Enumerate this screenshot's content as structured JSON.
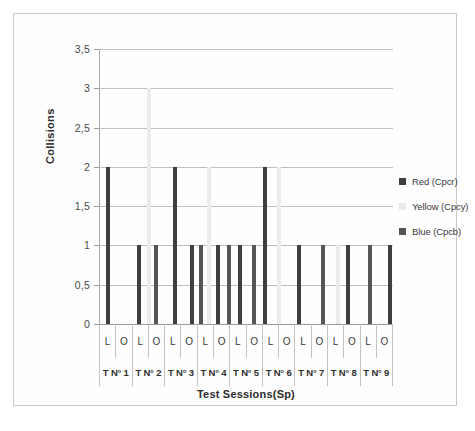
{
  "chart_data": {
    "type": "bar",
    "title": "",
    "xlabel": "Test Sessions(Sp)",
    "ylabel": "Collisions",
    "ylim": [
      0,
      3.5
    ],
    "ytick_labels": [
      "0",
      "0,5",
      "1",
      "1,5",
      "2",
      "2,5",
      "3",
      "3,5"
    ],
    "ytick_values": [
      0,
      0.5,
      1,
      1.5,
      2,
      2.5,
      3,
      3.5
    ],
    "grid": true,
    "legend_position": "right",
    "series": [
      {
        "name": "Red (Cpcr)",
        "color": "#3f3f3f"
      },
      {
        "name": "Yellow (Cpcy)",
        "color": "#ebebeb"
      },
      {
        "name": "Blue (Cpcb)",
        "color": "#555555"
      }
    ],
    "categories": [
      "T N° 1 L",
      "T N° 1 O",
      "T N° 2 L",
      "T N° 2 O",
      "T N° 3 L",
      "T N° 3 O",
      "T N° 4 L",
      "T N° 4 O",
      "T N° 5 L",
      "T N° 5 O",
      "T N° 6 L",
      "T N° 6 O",
      "T N° 7 L",
      "T N° 7 O",
      "T N° 8 L",
      "T N° 8 O",
      "T N° 9 L",
      "T N° 9 O"
    ],
    "sessions": [
      "T N° 1",
      "T N° 2",
      "T N° 3",
      "T N° 4",
      "T N° 5",
      "T N° 6",
      "T N° 7",
      "T N° 8",
      "T N° 9"
    ],
    "sublabels": [
      "L",
      "O",
      "L",
      "O",
      "L",
      "O",
      "L",
      "O",
      "L",
      "O",
      "L",
      "O",
      "L",
      "O",
      "L",
      "O",
      "L",
      "O"
    ],
    "bars": [
      {
        "x_pct": 2.4,
        "value": 2,
        "series": "Red (Cpcr)"
      },
      {
        "x_pct": 12.9,
        "value": 1,
        "series": "Red (Cpcr)"
      },
      {
        "x_pct": 16.3,
        "value": 3,
        "series": "Yellow (Cpcy)"
      },
      {
        "x_pct": 18.7,
        "value": 1,
        "series": "Blue (Cpcb)"
      },
      {
        "x_pct": 25.2,
        "value": 2,
        "series": "Red (Cpcr)"
      },
      {
        "x_pct": 30.9,
        "value": 1,
        "series": "Red (Cpcr)"
      },
      {
        "x_pct": 34.0,
        "value": 1,
        "series": "Blue (Cpcb)"
      },
      {
        "x_pct": 36.7,
        "value": 2,
        "series": "Yellow (Cpcy)"
      },
      {
        "x_pct": 39.8,
        "value": 1,
        "series": "Red (Cpcr)"
      },
      {
        "x_pct": 43.5,
        "value": 1,
        "series": "Blue (Cpcb)"
      },
      {
        "x_pct": 47.3,
        "value": 1,
        "series": "Red (Cpcr)"
      },
      {
        "x_pct": 52.0,
        "value": 1,
        "series": "Blue (Cpcb)"
      },
      {
        "x_pct": 55.8,
        "value": 2,
        "series": "Red (Cpcr)"
      },
      {
        "x_pct": 60.5,
        "value": 2,
        "series": "Yellow (Cpcy)"
      },
      {
        "x_pct": 67.3,
        "value": 1,
        "series": "Red (Cpcr)"
      },
      {
        "x_pct": 75.5,
        "value": 1,
        "series": "Blue (Cpcb)"
      },
      {
        "x_pct": 80.6,
        "value": 1,
        "series": "Yellow (Cpcy)"
      },
      {
        "x_pct": 84.0,
        "value": 1,
        "series": "Red (Cpcr)"
      },
      {
        "x_pct": 91.5,
        "value": 1,
        "series": "Blue (Cpcb)"
      },
      {
        "x_pct": 98.3,
        "value": 1,
        "series": "Red (Cpcr)"
      }
    ]
  },
  "axes": {
    "y_title": "Collisions",
    "x_title": "Test Sessions(Sp)"
  },
  "legend": {
    "items": [
      {
        "label": "Red (Cpcr)",
        "color": "#3f3f3f"
      },
      {
        "label": "Yellow (Cpcy)",
        "color": "#ebebeb"
      },
      {
        "label": "Blue (Cpcb)",
        "color": "#555555"
      }
    ]
  }
}
